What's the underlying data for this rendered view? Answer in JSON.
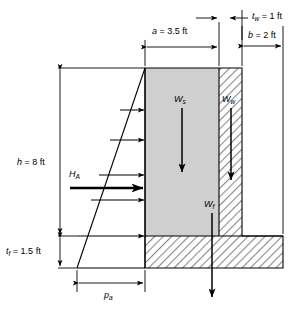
{
  "figure": {
    "type": "engineering-diagram",
    "colors": {
      "soil_fill": "#cfcfcf",
      "concrete_hatch": "#8a8a8a",
      "line": "#000000",
      "background": "#ffffff"
    }
  },
  "dimensions": {
    "a": {
      "symbol": "a",
      "label": "a = 3.5 ft",
      "value": 3.5,
      "unit": "ft",
      "description": "soil block width behind stem"
    },
    "tw": {
      "symbol": "t_w",
      "label": "t_w = 1 ft",
      "value": 1,
      "unit": "ft",
      "description": "wall stem thickness"
    },
    "b": {
      "symbol": "b",
      "label": "b = 2 ft",
      "value": 2,
      "unit": "ft",
      "description": "toe projection width"
    },
    "h": {
      "symbol": "h",
      "label": "h = 8 ft",
      "value": 8,
      "unit": "ft",
      "description": "stem height above footing"
    },
    "tf": {
      "symbol": "t_f",
      "label": "t_f = 1.5 ft",
      "value": 1.5,
      "unit": "ft",
      "description": "footing thickness"
    }
  },
  "forces": {
    "Ws": {
      "symbol": "W_s",
      "direction": "down",
      "description": "weight of soil above heel"
    },
    "Ww": {
      "symbol": "W_w",
      "direction": "down",
      "description": "weight of wall stem"
    },
    "Wf": {
      "symbol": "W_f",
      "direction": "down",
      "description": "weight of footing"
    },
    "HA": {
      "symbol": "H_A",
      "direction": "right",
      "description": "resultant active lateral earth force"
    }
  },
  "pressure_diagram": {
    "symbol": "p_a",
    "label": "p_a",
    "description": "active earth pressure distribution, triangular, increasing with depth",
    "shape": "triangular",
    "arrow_count": 6
  },
  "text": {
    "a_pre": "a",
    "a_post": " = 3.5 ft",
    "tw_pre": "t",
    "tw_sub": "w",
    "tw_post": " = 1 ft",
    "b_pre": "b",
    "b_post": " = 2 ft",
    "h_pre": "h",
    "h_post": " = 8 ft",
    "tf_pre": "t",
    "tf_sub": "f",
    "tf_post": " = 1.5 ft",
    "Ws_pre": "W",
    "Ws_sub": "s",
    "Ww_pre": "W",
    "Ww_sub": "w",
    "Wf_pre": "W",
    "Wf_sub": "f",
    "HA_pre": "H",
    "HA_sub": "A",
    "pa_pre": "p",
    "pa_sub": "a"
  }
}
